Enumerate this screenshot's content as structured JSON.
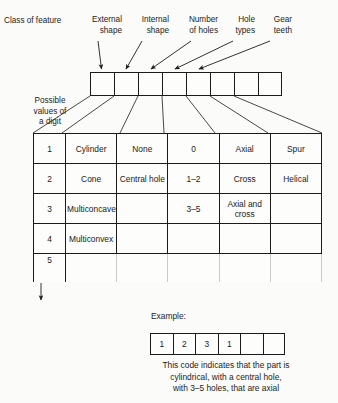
{
  "diagram": {
    "class_label": "Class of feature",
    "possible_values_label": "Possible\nvalues of\na digit",
    "feature_headers": [
      {
        "name": "external-shape",
        "label": "External\nshape"
      },
      {
        "name": "internal-shape",
        "label": "Internal\nshape"
      },
      {
        "name": "number-of-holes",
        "label": "Number\nof holes"
      },
      {
        "name": "hole-types",
        "label": "Hole\ntypes"
      },
      {
        "name": "gear-teeth",
        "label": "Gear\nteeth"
      }
    ],
    "code_strip": {
      "cell_count": 8,
      "values": [
        "",
        "",
        "",
        "",
        "",
        "",
        "",
        ""
      ]
    },
    "table": {
      "rows": [
        {
          "digit": "1",
          "cells": [
            "Cylinder",
            "None",
            "0",
            "Axial",
            "Spur"
          ]
        },
        {
          "digit": "2",
          "cells": [
            "Cone",
            "Central\nhole",
            "1–2",
            "Cross",
            "Helical"
          ]
        },
        {
          "digit": "3",
          "cells": [
            "Multiconcave",
            "",
            "3–5",
            "Axial and\ncross",
            ""
          ]
        },
        {
          "digit": "4",
          "cells": [
            "Multiconvex",
            "",
            "",
            "",
            ""
          ]
        },
        {
          "digit": "5",
          "cells": [
            "",
            "",
            "",
            "",
            ""
          ]
        }
      ]
    },
    "example": {
      "title": "Example:",
      "cell_count": 6,
      "values": [
        "1",
        "2",
        "3",
        "1",
        "",
        ""
      ],
      "caption": "This code indicates that the part is\ncylindrical, with a central hole,\nwith 3–5 holes, that are axial"
    },
    "colors": {
      "ink": "#1b1b1b",
      "paper": "#fbfbf9",
      "faded_rule": "#c9c9c6"
    }
  }
}
